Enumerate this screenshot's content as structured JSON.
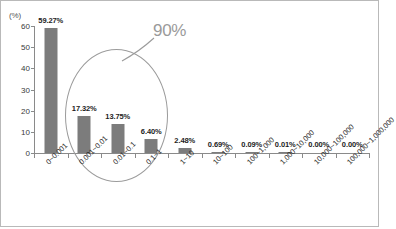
{
  "chart_data": {
    "type": "bar",
    "title": "",
    "subtitle": "",
    "xlabel": "",
    "ylabel": "",
    "unit_label": "(%)",
    "ylim": [
      0,
      60
    ],
    "yticks": [
      0,
      10,
      20,
      30,
      40,
      50,
      60
    ],
    "ytick_labels": [
      "0",
      "10",
      "20",
      "30",
      "40",
      "50",
      "60"
    ],
    "grid": false,
    "legend": "none",
    "bar_color": "#7c7c7c",
    "categories": [
      "0~0.001",
      "0.001~0.01",
      "0.01~0.1",
      "0.1~1",
      "1~10",
      "10~100",
      "100~1,000",
      "1,000~10,000",
      "10,000~100,000",
      "100,000~1,000,000"
    ],
    "values": [
      59.27,
      17.32,
      13.75,
      6.4,
      2.48,
      0.69,
      0.09,
      0.01,
      0.0,
      0.0
    ],
    "value_labels": [
      "59.27%",
      "17.32%",
      "13.75%",
      "6.40%",
      "2.48%",
      "0.69%",
      "0.09%",
      "0.01%",
      "0.00%",
      "0.00%"
    ],
    "annotations": [
      {
        "type": "ellipse-callout",
        "label": "90%",
        "color": "#9a9a9a",
        "encircles": [
          "0~0.001",
          "0.001~0.01",
          "0.01~0.1"
        ]
      }
    ]
  }
}
